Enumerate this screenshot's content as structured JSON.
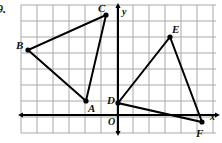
{
  "figure": {
    "problem_number": "9.",
    "width": 222,
    "height": 143,
    "background_color": "#ffffff"
  },
  "grid": {
    "line_color": "#a9a9a9",
    "spacing_px": 16,
    "x_min_px": 21,
    "x_max_px": 216,
    "y_min_px": 5,
    "y_max_px": 133,
    "vertical_line_count": 13,
    "horizontal_line_count": 9
  },
  "axes": {
    "color": "#000000",
    "origin_px": {
      "x": 118,
      "y": 115
    },
    "unit_px": 16,
    "x_axis": {
      "label": "x",
      "label_px": {
        "x": 210,
        "y": 112
      },
      "from_px": {
        "x": 23,
        "y": 115
      },
      "to_px": {
        "x": 215,
        "y": 115
      },
      "arrow_start": true,
      "arrow_end": true
    },
    "y_axis": {
      "label": "y",
      "label_px": {
        "x": 122,
        "y": 7
      },
      "from_px": {
        "x": 118,
        "y": 8
      },
      "to_px": {
        "x": 118,
        "y": 131
      },
      "arrow_start": true,
      "arrow_end": true
    },
    "origin_label": {
      "text": "O",
      "label_px": {
        "x": 108,
        "y": 117
      }
    }
  },
  "shapes": [
    {
      "name": "triangle-abc",
      "stroke_color": "#000000",
      "stroke_width": 2,
      "vertices": [
        {
          "label": "A",
          "px": {
            "x": 86,
            "y": 101
          },
          "coord": {
            "x": -2,
            "y": 1
          },
          "label_px": {
            "x": 88,
            "y": 103
          }
        },
        {
          "label": "B",
          "px": {
            "x": 28,
            "y": 50
          },
          "coord": {
            "x": -5.6,
            "y": 4
          },
          "label_px": {
            "x": 16,
            "y": 40
          }
        },
        {
          "label": "C",
          "px": {
            "x": 106,
            "y": 15
          },
          "coord": {
            "x": -0.75,
            "y": 6.25
          },
          "label_px": {
            "x": 98,
            "y": 3
          }
        }
      ]
    },
    {
      "name": "triangle-def",
      "stroke_color": "#000000",
      "stroke_width": 2,
      "vertices": [
        {
          "label": "D",
          "px": {
            "x": 118,
            "y": 103
          },
          "coord": {
            "x": 0,
            "y": 0.75
          },
          "label_px": {
            "x": 107,
            "y": 95
          }
        },
        {
          "label": "E",
          "px": {
            "x": 170,
            "y": 37
          },
          "coord": {
            "x": 3.25,
            "y": 4.875
          },
          "label_px": {
            "x": 172,
            "y": 24
          }
        },
        {
          "label": "F",
          "px": {
            "x": 202,
            "y": 122
          },
          "coord": {
            "x": 5.25,
            "y": -0.44
          },
          "label_px": {
            "x": 196,
            "y": 128
          }
        }
      ]
    }
  ],
  "vertex_dot": {
    "radius_px": 2.6,
    "color": "#000000"
  }
}
